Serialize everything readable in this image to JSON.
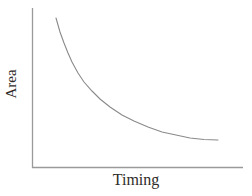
{
  "chart_data": {
    "type": "line",
    "title": "",
    "xlabel": "Timing",
    "ylabel": "Area",
    "x_ticks": [],
    "y_ticks": [],
    "legend": null,
    "grid": false,
    "axis_color": "#9a9a9a",
    "curve_color": "#8a8a8a",
    "text_color": "#2e2b28",
    "series": [
      {
        "name": "area-timing-tradeoff",
        "points_px": [
          [
            56,
            18
          ],
          [
            60,
            32
          ],
          [
            64,
            43
          ],
          [
            68,
            53
          ],
          [
            72,
            62
          ],
          [
            78,
            73
          ],
          [
            84,
            82
          ],
          [
            92,
            91
          ],
          [
            100,
            99
          ],
          [
            110,
            107
          ],
          [
            122,
            115
          ],
          [
            134,
            121
          ],
          [
            148,
            127
          ],
          [
            162,
            132
          ],
          [
            176,
            135
          ],
          [
            190,
            138
          ],
          [
            204,
            139.5
          ],
          [
            218,
            140
          ]
        ]
      }
    ]
  }
}
